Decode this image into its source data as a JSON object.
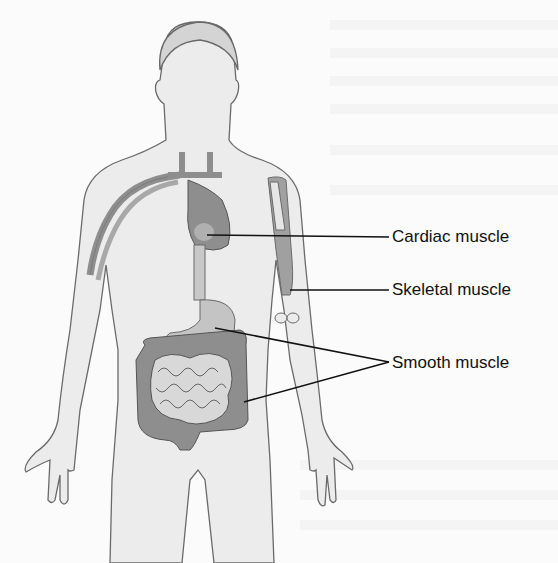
{
  "figure": {
    "labels": [
      {
        "id": "cardiac",
        "text": "Cardiac muscle",
        "points_to": "heart"
      },
      {
        "id": "skeletal",
        "text": "Skeletal muscle",
        "points_to": "upper arm"
      },
      {
        "id": "smooth",
        "text": "Smooth muscle",
        "points_to": [
          "stomach",
          "intestines"
        ]
      }
    ]
  },
  "colors": {
    "outline": "#6a6a6a",
    "skin": "#ececec",
    "organ_dark": "#8e8e8e",
    "organ_mid": "#a8a8a8",
    "organ_light": "#c8c8c8",
    "leader_line": "#111111"
  }
}
